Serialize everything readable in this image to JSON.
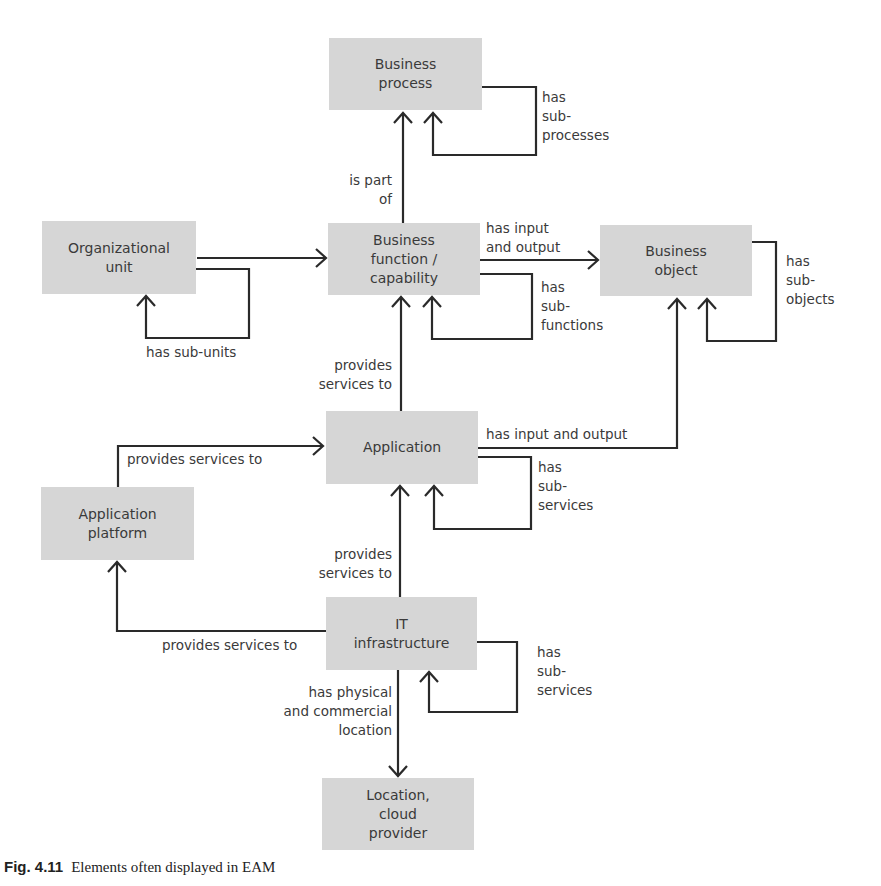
{
  "diagram": {
    "nodes": {
      "business_process": "Business\nprocess",
      "organizational_unit": "Organizational\nunit",
      "business_function": "Business\nfunction /\ncapability",
      "business_object": "Business\nobject",
      "application": "Application",
      "application_platform": "Application\nplatform",
      "it_infrastructure": "IT\ninfrastructure",
      "location": "Location,\ncloud\nprovider"
    },
    "edges": {
      "bp_sub": "has\nsub-\nprocesses",
      "bf_part_of": "is part\nof",
      "bf_io": "has input\nand output",
      "bf_sub": "has\nsub-\nfunctions",
      "ou_sub": "has sub-units",
      "bo_sub": "has\nsub-\nobjects",
      "app_provides_bf": "provides\nservices to",
      "app_io": "has input and output",
      "app_sub": "has\nsub-\nservices",
      "plat_provides_app": "provides services to",
      "it_provides_app": "provides\nservices to",
      "it_provides_plat": "provides services to",
      "it_sub": "has\nsub-\nservices",
      "it_location": "has physical\nand commercial\nlocation"
    }
  },
  "caption": {
    "label": "Fig. 4.11",
    "text": "Elements often displayed in EAM"
  },
  "colors": {
    "node_fill": "#d6d6d6",
    "line": "#2a2a2a",
    "text": "#3a3a3a"
  }
}
